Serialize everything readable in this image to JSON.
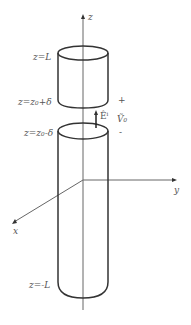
{
  "figure": {
    "axes": {
      "z_label": "z",
      "y_label": "y",
      "x_label": "x"
    },
    "labels": {
      "top": "z=L",
      "gap_top": "z=z₀+δ",
      "gap_bottom": "z=z₀-δ",
      "bottom": "z=-L",
      "field": "Êⁱ",
      "voltage": "Ṽ₀",
      "plus": "+",
      "minus": "-"
    },
    "colors": {
      "stroke": "#333333",
      "axis": "#666666",
      "text": "#555555"
    }
  }
}
